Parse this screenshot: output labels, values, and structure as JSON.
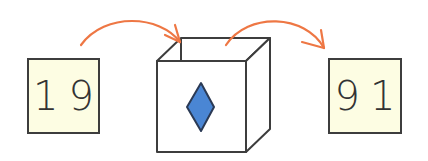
{
  "diagram": {
    "input": {
      "label": "19",
      "fill": "#fdfde3"
    },
    "output": {
      "label": "91",
      "fill": "#fdfde3"
    },
    "machine": {
      "type": "open box",
      "symbol": "diamond-shape",
      "symbol_color": "#4a86d4"
    },
    "arrow_color": "#ee7744",
    "stroke_color": "#3d3d3d"
  }
}
